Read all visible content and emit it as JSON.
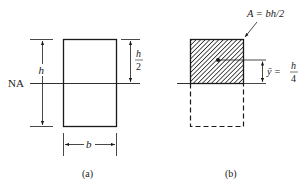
{
  "figure_a": {
    "neutral_axis_label": "NA",
    "height_label": "h",
    "half_height_numerator": "h",
    "half_height_denominator": "2",
    "width_label": "b",
    "caption": "(a)"
  },
  "figure_b": {
    "area_label": "A = bh/2",
    "centroid_label": "ȳ =",
    "centroid_numerator": "h",
    "centroid_denominator": "4",
    "caption": "(b)"
  },
  "colors": {
    "ink": "#1a1a1a",
    "hatch": "#2a2a2a",
    "background": "#ffffff"
  }
}
